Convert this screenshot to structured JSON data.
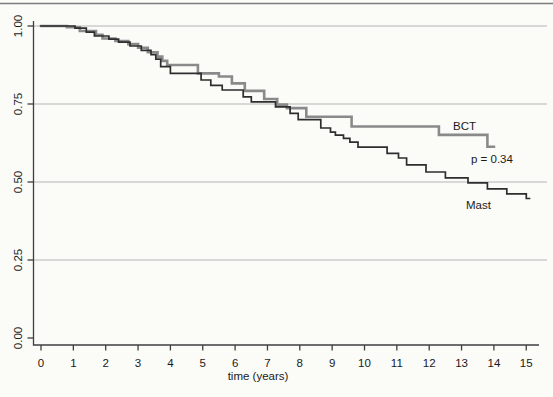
{
  "page": {
    "background_color": "#fbfbf8",
    "top_rule_color": "#7d7d7d"
  },
  "chart_data": {
    "type": "line",
    "subtype": "kaplan_meier_step_survival",
    "title": "",
    "xlabel": "time (years)",
    "ylabel": "",
    "xlim": [
      0,
      15
    ],
    "ylim": [
      0.0,
      1.0
    ],
    "x_ticks": [
      0,
      1,
      2,
      3,
      4,
      5,
      6,
      7,
      8,
      9,
      10,
      11,
      12,
      13,
      14,
      15
    ],
    "y_ticks": [
      "0.00",
      "0.25",
      "0.50",
      "0.75",
      "1.00"
    ],
    "y_tick_values": [
      0.0,
      0.25,
      0.5,
      0.75,
      1.0
    ],
    "y_gridline_values": [
      0.25,
      0.5,
      0.75,
      1.0
    ],
    "grid": "horizontal-only",
    "legend_position": "inline-annotations",
    "axis_color": "#3f3f3f",
    "grid_color": "#b5b5b5",
    "text_color": "#1a1a1a",
    "annotations": [
      {
        "text": "BCT",
        "role": "series-label"
      },
      {
        "text": "p = 0.34",
        "role": "p-value"
      },
      {
        "text": "Mast",
        "role": "series-label"
      }
    ],
    "series": [
      {
        "name": "BCT",
        "color": "#8a8a8a",
        "stroke_width": 2.6,
        "end_t": 14.0,
        "points": [
          [
            0,
            1.0
          ],
          [
            0.8,
            0.996
          ],
          [
            1.2,
            0.984
          ],
          [
            1.7,
            0.972
          ],
          [
            1.9,
            0.96
          ],
          [
            2.3,
            0.952
          ],
          [
            2.7,
            0.942
          ],
          [
            3.0,
            0.93
          ],
          [
            3.3,
            0.916
          ],
          [
            3.6,
            0.902
          ],
          [
            3.75,
            0.888
          ],
          [
            3.9,
            0.875
          ],
          [
            4.85,
            0.848
          ],
          [
            5.5,
            0.838
          ],
          [
            5.9,
            0.816
          ],
          [
            6.3,
            0.792
          ],
          [
            6.9,
            0.766
          ],
          [
            7.3,
            0.748
          ],
          [
            7.6,
            0.737
          ],
          [
            8.2,
            0.709
          ],
          [
            9.6,
            0.678
          ],
          [
            12.3,
            0.651
          ],
          [
            13.8,
            0.613
          ]
        ]
      },
      {
        "name": "Mast",
        "color": "#2e2e2e",
        "stroke_width": 1.7,
        "end_t": 15.1,
        "points": [
          [
            0,
            1.0
          ],
          [
            1.05,
            0.993
          ],
          [
            1.4,
            0.98
          ],
          [
            1.65,
            0.968
          ],
          [
            2.1,
            0.958
          ],
          [
            2.4,
            0.948
          ],
          [
            2.75,
            0.936
          ],
          [
            3.1,
            0.922
          ],
          [
            3.4,
            0.908
          ],
          [
            3.55,
            0.894
          ],
          [
            3.7,
            0.87
          ],
          [
            4.0,
            0.848
          ],
          [
            4.95,
            0.827
          ],
          [
            5.25,
            0.81
          ],
          [
            5.6,
            0.795
          ],
          [
            6.25,
            0.773
          ],
          [
            6.5,
            0.757
          ],
          [
            7.25,
            0.741
          ],
          [
            7.7,
            0.72
          ],
          [
            7.95,
            0.7
          ],
          [
            8.65,
            0.673
          ],
          [
            8.95,
            0.66
          ],
          [
            9.1,
            0.65
          ],
          [
            9.35,
            0.64
          ],
          [
            9.55,
            0.628
          ],
          [
            9.8,
            0.612
          ],
          [
            10.7,
            0.592
          ],
          [
            11.05,
            0.577
          ],
          [
            11.3,
            0.555
          ],
          [
            11.9,
            0.532
          ],
          [
            12.5,
            0.513
          ],
          [
            13.2,
            0.497
          ],
          [
            13.8,
            0.478
          ],
          [
            14.4,
            0.462
          ],
          [
            15.0,
            0.447
          ]
        ]
      }
    ]
  }
}
